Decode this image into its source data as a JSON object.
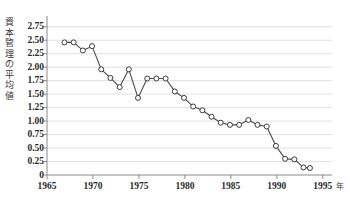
{
  "chart_data": {
    "type": "line",
    "title": "",
    "subtitle": "",
    "ylabel": "資本管理の平均値",
    "xlabel": "",
    "x_unit_label": "年",
    "grid": true,
    "legend": null,
    "xlim": [
      1965,
      1996
    ],
    "ylim": [
      0,
      2.875
    ],
    "ytick_labels": [
      "2.75",
      "2.50",
      "2.25",
      "2.00",
      "1.75",
      "1.50",
      "1.25",
      "1.00",
      "0.75",
      "0.50",
      "0.25",
      "0"
    ],
    "ytick_values": [
      2.75,
      2.5,
      2.25,
      2.0,
      1.75,
      1.5,
      1.25,
      1.0,
      0.75,
      0.5,
      0.25,
      0
    ],
    "xtick_labels": [
      "1965",
      "1970",
      "1975",
      "1980",
      "1985",
      "1990",
      "1995"
    ],
    "xtick_values": [
      1965,
      1970,
      1975,
      1980,
      1985,
      1990,
      1995
    ],
    "marker": "open-circle",
    "line_color": "#4a4a4a",
    "marker_fill": "#ffffff",
    "marker_stroke": "#3c3c3c",
    "grid_color": "#d8d8d8",
    "axis_color": "#8a8a8a",
    "series": [
      {
        "name": "資本管理の平均値",
        "x": [
          1966.9,
          1967.9,
          1968.9,
          1969.9,
          1970.9,
          1971.9,
          1972.9,
          1973.9,
          1974.9,
          1975.9,
          1976.9,
          1977.9,
          1978.9,
          1979.9,
          1980.9,
          1981.9,
          1982.9,
          1983.9,
          1984.9,
          1985.9,
          1986.9,
          1987.9,
          1988.9,
          1989.9,
          1990.9,
          1991.9,
          1992.9,
          1993.6
        ],
        "y": [
          2.46,
          2.46,
          2.31,
          2.39,
          1.96,
          1.8,
          1.63,
          1.96,
          1.43,
          1.79,
          1.79,
          1.79,
          1.55,
          1.43,
          1.27,
          1.2,
          1.08,
          0.97,
          0.93,
          0.93,
          1.02,
          0.93,
          0.9,
          0.54,
          0.3,
          0.29,
          0.14,
          0.13
        ]
      }
    ]
  }
}
